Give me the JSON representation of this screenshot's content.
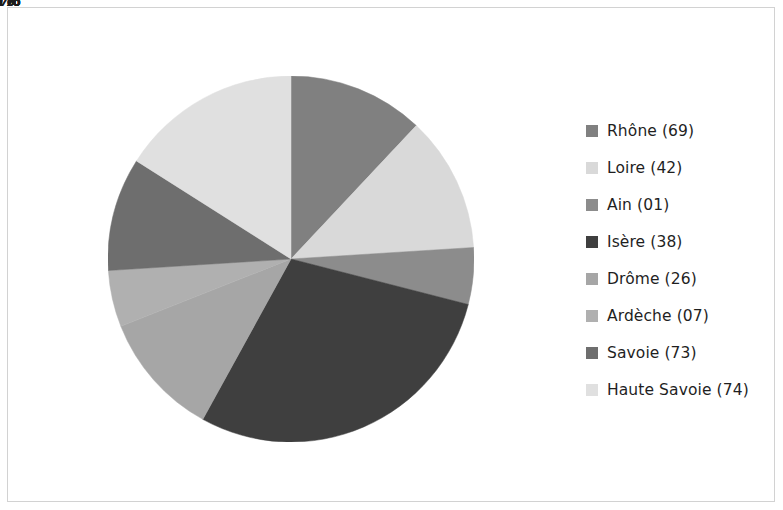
{
  "chart_data": {
    "type": "pie",
    "title": "",
    "subtitle": "",
    "xlabel": "",
    "ylabel": "",
    "legend_position": "right",
    "grid": false,
    "start_angle_deg": 0,
    "direction": "clockwise",
    "categories": [
      "Rhône (69)",
      "Loire (42)",
      "Ain (01)",
      "Isère (38)",
      "Drôme (26)",
      "Ardèche (07)",
      "Savoie (73)",
      "Haute Savoie (74)"
    ],
    "values": [
      12,
      12,
      5,
      29,
      11,
      5,
      10,
      16
    ],
    "data_labels": [
      "12%",
      "12%",
      "5%",
      "29%",
      "11%",
      "5%",
      "10%",
      "16%"
    ],
    "colors": [
      "#808080",
      "#d9d9d9",
      "#8c8c8c",
      "#3f3f3f",
      "#a6a6a6",
      "#b0b0b0",
      "#6e6e6e",
      "#e0e0e0"
    ],
    "total": 100,
    "units": "percent"
  },
  "legend": {
    "items": [
      {
        "label": "Rhône (69)",
        "color": "#808080",
        "value": "12%"
      },
      {
        "label": "Loire (42)",
        "color": "#d9d9d9",
        "value": "12%"
      },
      {
        "label": "Ain (01)",
        "color": "#8c8c8c",
        "value": "5%"
      },
      {
        "label": "Isère (38)",
        "color": "#3f3f3f",
        "value": "29%"
      },
      {
        "label": "Drôme (26)",
        "color": "#a6a6a6",
        "value": "11%"
      },
      {
        "label": "Ardèche (07)",
        "color": "#b0b0b0",
        "value": "5%"
      },
      {
        "label": "Savoie (73)",
        "color": "#6e6e6e",
        "value": "10%"
      },
      {
        "label": "Haute Savoie (74)",
        "color": "#e0e0e0",
        "value": "16%"
      }
    ]
  },
  "frame": {
    "border_color": "#d2d2d2",
    "background": "#ffffff"
  },
  "geometry": {
    "center_x": 291,
    "center_y": 259,
    "radius": 172,
    "label_radius_ratio": 0.66
  }
}
